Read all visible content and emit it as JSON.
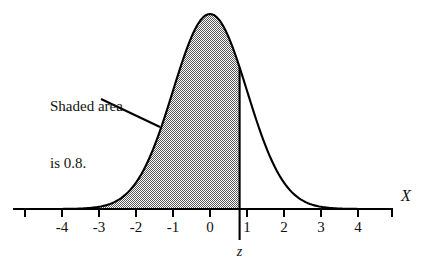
{
  "figure": {
    "kind": "normal-distribution-shaded-area",
    "background_color": "#ffffff",
    "line_color": "#000000",
    "shade_fill_color": "#8c8c8c"
  },
  "annotation": {
    "line1": "Shaded area",
    "line2": "is 0.8.",
    "leader_line": true
  },
  "axes": {
    "x_label": "X",
    "z_label": "z",
    "tick_labels": [
      "-4",
      "-3",
      "-2",
      "-1",
      "0",
      "1",
      "2",
      "3",
      "4"
    ],
    "tick_values": [
      -4,
      -3,
      -2,
      -1,
      0,
      1,
      2,
      3,
      4
    ]
  },
  "chart_data": {
    "type": "area",
    "title": "",
    "subtitle": "",
    "xlabel": "X",
    "ylabel": "",
    "grid": false,
    "legend": "none",
    "xlim": [
      -5.05,
      4.9
    ],
    "ylim": [
      0,
      0.445
    ],
    "curve": {
      "name": "standard normal density",
      "distribution": "normal",
      "mean": 0,
      "sd": 1,
      "peak_value": 0.3989
    },
    "shaded_region": {
      "from": -5.05,
      "to": 0.8,
      "area": 0.8,
      "label": "Shaded area is 0.8.",
      "fill": "#8c8c8c",
      "boundary_line_x": 0.8,
      "boundary_label": "z"
    },
    "x": [
      -5.0,
      -4.75,
      -4.5,
      -4.25,
      -4.0,
      -3.75,
      -3.5,
      -3.25,
      -3.0,
      -2.75,
      -2.5,
      -2.25,
      -2.0,
      -1.75,
      -1.5,
      -1.25,
      -1.0,
      -0.75,
      -0.5,
      -0.25,
      0.0,
      0.25,
      0.5,
      0.75,
      1.0,
      1.25,
      1.5,
      1.75,
      2.0,
      2.25,
      2.5,
      2.75,
      3.0,
      3.25,
      3.5,
      3.75,
      4.0,
      4.25,
      4.5,
      4.75
    ],
    "y": [
      0.0,
      0.0,
      0.0,
      0.0001,
      0.0001,
      0.0004,
      0.0009,
      0.002,
      0.0044,
      0.0091,
      0.0175,
      0.0317,
      0.054,
      0.0863,
      0.1295,
      0.1826,
      0.242,
      0.3011,
      0.3521,
      0.3867,
      0.3989,
      0.3867,
      0.3521,
      0.3011,
      0.242,
      0.1826,
      0.1295,
      0.0863,
      0.054,
      0.0317,
      0.0175,
      0.0091,
      0.0044,
      0.002,
      0.0009,
      0.0004,
      0.0001,
      0.0001,
      0.0,
      0.0
    ],
    "ticks": {
      "x_major": [
        -4,
        -3,
        -2,
        -1,
        0,
        1,
        2,
        3,
        4
      ],
      "x_minor_unlabeled": [
        -5
      ]
    }
  }
}
